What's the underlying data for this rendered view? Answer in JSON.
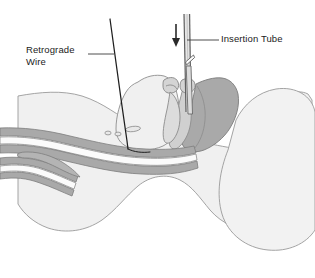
{
  "figure": {
    "kind": "medical-illustration",
    "background_color": "#ffffff"
  },
  "labels": {
    "retrograde_wire": {
      "text": "Retrograde\nWire",
      "color": "#1b1b1b",
      "leader_from_x": 88,
      "leader_from_y": 54,
      "leader_to_x": 114,
      "leader_to_y": 54
    },
    "insertion_tube": {
      "text": "Insertion Tube",
      "color": "#1b1b1b",
      "leader_from_x": 187,
      "leader_from_y": 40,
      "leader_to_x": 219,
      "leader_to_y": 40
    }
  },
  "instruments": {
    "insertion_tube": {
      "name": "insertion-tube",
      "color": "#6b6b6b",
      "left_wall_x": 184,
      "right_wall_x": 189.5,
      "top_y": 14,
      "bevel_y": 58,
      "tip_y": 112
    },
    "direction_arrow": {
      "name": "down-arrow",
      "color": "#2a2a2a",
      "x": 176,
      "top_y": 24,
      "bottom_y": 46
    },
    "retrograde_wire": {
      "name": "retrograde-wire",
      "color": "#1f1f1f",
      "start_x": 110,
      "start_y": 19,
      "end_x": 128,
      "end_y": 148
    }
  },
  "palette": {
    "tissue_light": "#f0f0f0",
    "tissue_mid": "#e2e2e2",
    "tissue_dark": "#a9a9a9",
    "cartilage": "#d6d6d6",
    "outline": "#8a8a8a",
    "outline_dark": "#6e6e6e",
    "white": "#ffffff"
  },
  "anatomy": [
    {
      "name": "head-soft-tissue-mass",
      "shade": "tissue_light"
    },
    {
      "name": "occiput-posterior-head",
      "shade": "tissue_light"
    },
    {
      "name": "posterior-pharyngeal-wall",
      "shade": "tissue_dark"
    },
    {
      "name": "tongue-and-oral-floor",
      "shade": "tissue_light"
    },
    {
      "name": "hyoid-and-laryngeal-cartilage",
      "shade": "cartilage"
    },
    {
      "name": "epiglottis",
      "shade": "cartilage"
    },
    {
      "name": "trachea-lumen",
      "shade": "white"
    },
    {
      "name": "esophagus-lumen",
      "shade": "white"
    },
    {
      "name": "tracheal-rings",
      "shade": "cartilage"
    },
    {
      "name": "airway-bifurcation",
      "shade": "tissue_dark"
    }
  ]
}
